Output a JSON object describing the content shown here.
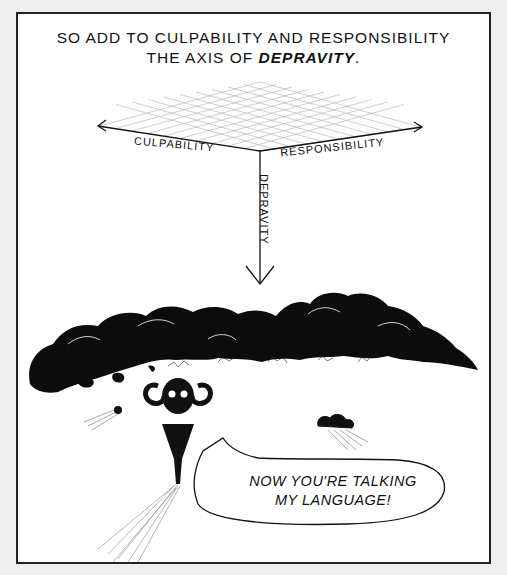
{
  "panel": {
    "caption": {
      "line1": "SO ADD TO CULPABILITY AND RESPONSIBILITY",
      "line2_prefix": "THE AXIS OF ",
      "line2_emphasis": "DEPRAVITY",
      "line2_suffix": "."
    },
    "diagram": {
      "axes": [
        {
          "name": "culpability",
          "label": "CULPABILITY",
          "direction": "left"
        },
        {
          "name": "responsibility",
          "label": "RESPONSIBILITY",
          "direction": "right"
        },
        {
          "name": "depravity",
          "label": "DEPRAVITY",
          "direction": "down"
        }
      ]
    },
    "speech_bubble": {
      "line1": "NOW YOU'RE TALKING",
      "line2": "MY LANGUAGE!"
    }
  }
}
